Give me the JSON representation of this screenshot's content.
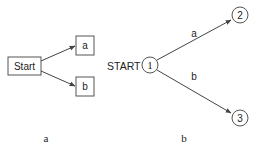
{
  "diagram_a": {
    "caption": "a",
    "start_label": "Start",
    "nodes": [
      {
        "id": "a",
        "label": "a"
      },
      {
        "id": "b",
        "label": "b"
      }
    ]
  },
  "diagram_b": {
    "caption": "b",
    "start_label": "START",
    "nodes": [
      {
        "id": "1",
        "label": "1"
      },
      {
        "id": "2",
        "label": "2"
      },
      {
        "id": "3",
        "label": "3"
      }
    ],
    "edges": [
      {
        "from": "1",
        "to": "2",
        "label": "a"
      },
      {
        "from": "1",
        "to": "3",
        "label": "b"
      }
    ]
  },
  "colors": {
    "stroke": "#555555",
    "text": "#222222",
    "arrow": "#444444"
  }
}
